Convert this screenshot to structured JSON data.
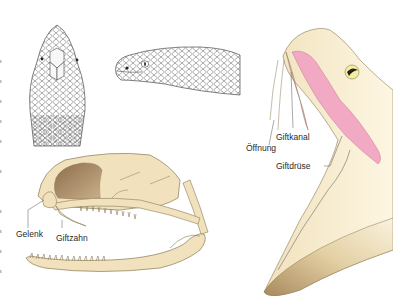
{
  "figure": {
    "panels": [
      {
        "id": "head-top-view",
        "description": "Snake head, dorsal view, scaled"
      },
      {
        "id": "head-side-view",
        "description": "Snake head, lateral view, scaled"
      },
      {
        "id": "skull-side-view",
        "description": "Snake skull with open jaws"
      },
      {
        "id": "venom-apparatus",
        "description": "Cross-section of head with venom gland and fang"
      }
    ],
    "labels": {
      "giftkanal": "Giftkanal",
      "oeffnung": "Öffnung",
      "giftdruese": "Giftdrüse",
      "gelenk": "Gelenk",
      "giftzahn": "Giftzahn"
    },
    "colors": {
      "bone": "#f1e2bd",
      "bone_outline": "#8a7a55",
      "bone_dark": "#a98b63",
      "gland": "#f2a9c4",
      "scale_line": "#4a4a4a",
      "eye_yellow": "#f6eda0"
    }
  }
}
